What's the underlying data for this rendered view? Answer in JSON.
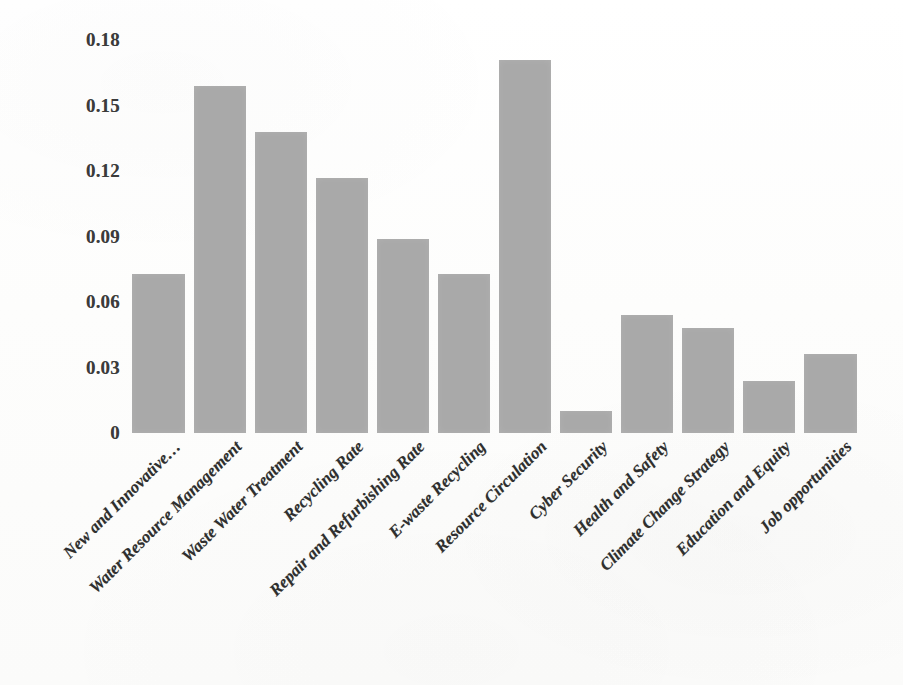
{
  "chart_data": {
    "type": "bar",
    "title": "",
    "subtitle": "",
    "xlabel": "",
    "ylabel": "",
    "ylim": [
      0,
      0.18
    ],
    "ytick_labels": [
      "0.18",
      "0.15",
      "0.12",
      "0.09",
      "0.06",
      "0.03",
      "0"
    ],
    "ytick_values": [
      0.18,
      0.15,
      0.12,
      0.09,
      0.06,
      0.03,
      0
    ],
    "grid": false,
    "legend": false,
    "legend_position": "none",
    "bar_color": "#a9a9a9",
    "background_color": "#fefefe",
    "label_rotation_degrees": 45,
    "categories": [
      "New and Innovative…",
      "Water Resource Management",
      "Waste Water Treatment",
      "Recycling Rate",
      "Repair and Refurbishing Rate",
      "E-waste Recycling",
      "Resource Circulation",
      "Cyber Security",
      "Health and Safety",
      "Climate Change Strategy",
      "Education and Equity",
      "Job opportunities"
    ],
    "values": [
      0.073,
      0.159,
      0.138,
      0.117,
      0.089,
      0.073,
      0.171,
      0.01,
      0.054,
      0.048,
      0.024,
      0.036
    ]
  }
}
